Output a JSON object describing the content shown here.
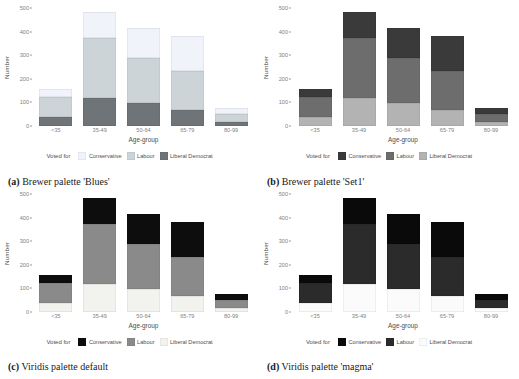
{
  "page_header": {
    "left": "",
    "right": ""
  },
  "axis": {
    "ylabel": "Number",
    "xlabel": "Age-group",
    "yticks": [
      "0",
      "100",
      "200",
      "300",
      "400",
      "500"
    ],
    "xticks": [
      "<35",
      "35-49",
      "50-64",
      "65-79",
      "80-99"
    ]
  },
  "legend": {
    "title": "Voted for",
    "items": [
      "Conservative",
      "Labour",
      "Liberal Democrat"
    ]
  },
  "panels": [
    {
      "key": "a",
      "tag": "(a)",
      "caption": "Brewer palette 'Blues'",
      "palette": {
        "conservative": "#f0f4fa",
        "labour": "#cdd4d8",
        "liberal_democrat": "#6f7478"
      }
    },
    {
      "key": "b",
      "tag": "(b)",
      "caption": "Brewer palette 'Set1'",
      "palette": {
        "conservative": "#3a3a3a",
        "labour": "#6d6d6d",
        "liberal_democrat": "#b3b3b3"
      }
    },
    {
      "key": "c",
      "tag": "(c)",
      "caption": "Viridis palette default",
      "palette": {
        "conservative": "#0d0d0d",
        "labour": "#8a8a8a",
        "liberal_democrat": "#f2f2ee"
      }
    },
    {
      "key": "d",
      "tag": "(d)",
      "caption": "Viridis palette 'magma'",
      "palette": {
        "conservative": "#0a0a0a",
        "labour": "#2b2b2b",
        "liberal_democrat": "#fbfbfb"
      }
    }
  ],
  "chart_data": {
    "type": "bar",
    "title": "",
    "xlabel": "Age-group",
    "ylabel": "Number",
    "ylim": [
      0,
      500
    ],
    "grid": false,
    "stacked": true,
    "legend_position": "bottom",
    "legend_title": "Voted for",
    "categories": [
      "<35",
      "35-49",
      "50-64",
      "65-79",
      "80-99"
    ],
    "series": [
      {
        "name": "Liberal Democrat",
        "values": [
          40,
          120,
          97,
          68,
          18
        ]
      },
      {
        "name": "Labour",
        "values": [
          82,
          252,
          190,
          165,
          33
        ]
      },
      {
        "name": "Conservative",
        "values": [
          36,
          112,
          130,
          148,
          27
        ]
      }
    ],
    "series_order_bottom_to_top": [
      "Liberal Democrat",
      "Labour",
      "Conservative"
    ],
    "totals": [
      158,
      484,
      417,
      381,
      78
    ],
    "note": "Four panels show the same stacked bar data rendered with four different colour palettes."
  }
}
